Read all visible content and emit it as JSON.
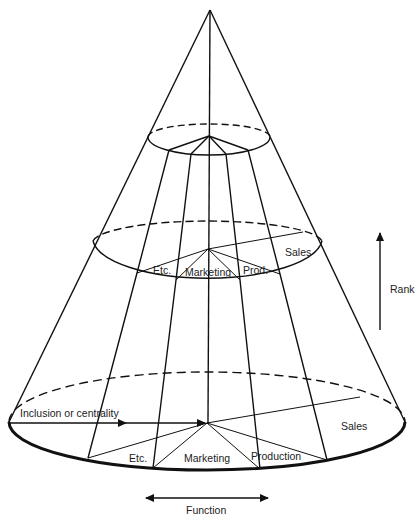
{
  "diagram": {
    "colors": {
      "line": "#111111",
      "background": "#ffffff",
      "text": "#222222"
    },
    "levels": {
      "middle": {
        "sectors": [
          "Etc.",
          "Marketing",
          "Prod.",
          "Sales"
        ]
      },
      "base": {
        "sectors": [
          "Etc.",
          "Marketing",
          "Production",
          "Sales"
        ]
      }
    },
    "axes": {
      "rank": "Rank",
      "function": "Function",
      "inclusion": "Inclusion or centrality"
    }
  }
}
